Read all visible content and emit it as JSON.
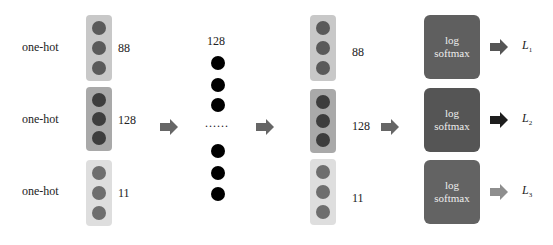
{
  "inputs": [
    {
      "label": "one-hot",
      "dim": "88",
      "box_color": "#c8c8c8",
      "dot_color": "#5a5a5a"
    },
    {
      "label": "one-hot",
      "dim": "128",
      "box_color": "#a9a9a9",
      "dot_color": "#3d3d3d"
    },
    {
      "label": "one-hot",
      "dim": "11",
      "box_color": "#dedede",
      "dot_color": "#6e6e6e"
    }
  ],
  "hidden": {
    "dim": "128",
    "ellipsis": "......",
    "dot_color": "#000000"
  },
  "outputs": [
    {
      "dim": "88",
      "box_color": "#c8c8c8",
      "dot_color": "#5a5a5a"
    },
    {
      "dim": "128",
      "box_color": "#a9a9a9",
      "dot_color": "#3d3d3d"
    },
    {
      "dim": "11",
      "box_color": "#dedede",
      "dot_color": "#6e6e6e"
    }
  ],
  "softmax": [
    {
      "line1": "log",
      "line2": "softmax",
      "color": "#5f5f5f",
      "arrow_color": "#555555",
      "loss": "L",
      "loss_sub": "1"
    },
    {
      "line1": "log",
      "line2": "softmax",
      "color": "#555555",
      "arrow_color": "#1e1e1e",
      "loss": "L",
      "loss_sub": "2"
    },
    {
      "line1": "log",
      "line2": "softmax",
      "color": "#636363",
      "arrow_color": "#8e8e8e",
      "loss": "L",
      "loss_sub": "3"
    }
  ],
  "arrow_color": "#666666"
}
